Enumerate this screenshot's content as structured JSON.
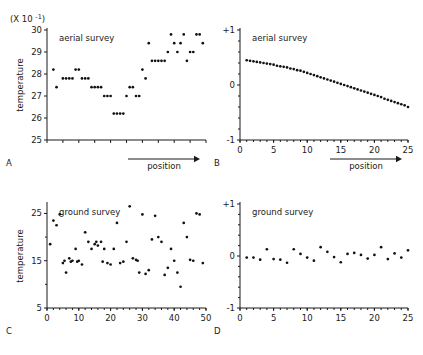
{
  "figure": {
    "multiplier_label": "(X 10",
    "multiplier_exp": "-1",
    "multiplier_close": ")"
  },
  "chart_data": [
    {
      "type": "scatter",
      "panel": "A",
      "panel_label": "A",
      "title": "aerial survey",
      "xlabel": "position",
      "ylabel": "temperature",
      "y_multiplier": "(X 10^-1)",
      "xlim": [
        0,
        50
      ],
      "ylim": [
        25,
        30
      ],
      "yticks": [
        25,
        26,
        27,
        28,
        29,
        30
      ],
      "ytick_labels": [
        "25",
        "26",
        "27",
        "28",
        "29",
        "30"
      ],
      "xticks": [],
      "xtick_labels": [],
      "grid": false,
      "x_axis_arrow": true,
      "x": [
        2,
        3,
        5,
        6,
        7,
        8,
        9,
        10,
        11,
        12,
        13,
        14,
        15,
        16,
        17,
        18,
        19,
        20,
        21,
        22,
        23,
        24,
        25,
        26,
        27,
        28,
        29,
        30,
        31,
        32,
        33,
        34,
        35,
        36,
        37,
        38,
        39,
        40,
        41,
        42,
        43,
        44,
        45,
        46,
        47,
        48,
        49
      ],
      "y": [
        28.2,
        27.4,
        27.8,
        27.8,
        27.8,
        27.8,
        28.2,
        28.2,
        27.8,
        27.8,
        27.8,
        27.4,
        27.4,
        27.4,
        27.4,
        27.0,
        27.0,
        27.0,
        26.2,
        26.2,
        26.2,
        26.2,
        27.0,
        27.4,
        27.4,
        27.0,
        27.0,
        28.2,
        27.8,
        29.4,
        28.6,
        28.6,
        28.6,
        28.6,
        28.6,
        29.0,
        29.8,
        29.4,
        29.0,
        29.4,
        29.8,
        28.6,
        29.0,
        29.0,
        29.8,
        29.8,
        29.4
      ]
    },
    {
      "type": "scatter",
      "panel": "B",
      "panel_label": "B",
      "title": "aerial survey",
      "xlabel": "position",
      "ylabel": "",
      "xlim": [
        0,
        25
      ],
      "ylim": [
        -1,
        1
      ],
      "yticks": [
        -1,
        0,
        1
      ],
      "ytick_labels": [
        "-1",
        "0",
        "+1"
      ],
      "xticks": [
        0,
        5,
        10,
        15,
        20,
        25
      ],
      "xtick_labels": [
        "0",
        "5",
        "10",
        "15",
        "20",
        "25"
      ],
      "grid": false,
      "x_axis_arrow": true,
      "x": [
        1,
        1.5,
        2,
        2.5,
        3,
        3.5,
        4,
        4.5,
        5,
        5.5,
        6,
        6.5,
        7,
        7.5,
        8,
        8.5,
        9,
        9.5,
        10,
        10.5,
        11,
        11.5,
        12,
        12.5,
        13,
        13.5,
        14,
        14.5,
        15,
        15.5,
        16,
        16.5,
        17,
        17.5,
        18,
        18.5,
        19,
        19.5,
        20,
        20.5,
        21,
        21.5,
        22,
        22.5,
        23,
        23.5,
        24,
        24.5,
        25
      ],
      "y": [
        0.45,
        0.44,
        0.43,
        0.42,
        0.41,
        0.4,
        0.39,
        0.38,
        0.37,
        0.35,
        0.34,
        0.33,
        0.32,
        0.3,
        0.29,
        0.27,
        0.26,
        0.24,
        0.22,
        0.2,
        0.18,
        0.16,
        0.14,
        0.12,
        0.1,
        0.08,
        0.06,
        0.04,
        0.02,
        0.0,
        -0.02,
        -0.04,
        -0.06,
        -0.08,
        -0.1,
        -0.12,
        -0.14,
        -0.16,
        -0.18,
        -0.2,
        -0.22,
        -0.25,
        -0.27,
        -0.29,
        -0.31,
        -0.33,
        -0.35,
        -0.37,
        -0.4
      ]
    },
    {
      "type": "scatter",
      "panel": "C",
      "panel_label": "C",
      "title": "ground survey",
      "xlabel": "",
      "ylabel": "temperature",
      "xlim": [
        0,
        50
      ],
      "ylim": [
        5,
        27
      ],
      "yticks": [
        5,
        15,
        25
      ],
      "ytick_labels": [
        "5",
        "15",
        "25"
      ],
      "xticks": [
        0,
        10,
        20,
        30,
        40,
        50
      ],
      "xtick_labels": [
        "0",
        "10",
        "20",
        "30",
        "40",
        "50"
      ],
      "grid": false,
      "x_axis_arrow": false,
      "x": [
        1,
        2,
        3,
        4,
        5,
        5.5,
        6,
        7,
        7.5,
        8,
        9,
        9.5,
        10,
        11,
        12,
        13,
        14,
        15,
        15.5,
        16,
        17,
        17.5,
        18,
        19,
        20,
        21,
        22,
        23,
        24,
        25,
        26,
        27,
        28,
        28.5,
        29,
        30,
        31,
        32,
        33,
        34,
        35,
        36,
        37,
        38,
        39,
        40,
        41,
        42,
        43,
        44,
        45,
        46,
        47,
        48,
        49
      ],
      "y": [
        18.5,
        23.5,
        22.5,
        24.8,
        14.5,
        15.0,
        12.5,
        15.5,
        14.8,
        15.0,
        17.5,
        14.8,
        15.0,
        14.2,
        21.0,
        19.0,
        17.5,
        18.5,
        19.0,
        18.2,
        19.0,
        14.8,
        17.5,
        14.5,
        14.2,
        17.5,
        23.0,
        14.5,
        14.8,
        19.0,
        26.5,
        15.5,
        15.2,
        15.0,
        12.5,
        24.8,
        12.2,
        13.0,
        19.5,
        24.5,
        20.0,
        19.0,
        12.0,
        13.5,
        17.5,
        15.0,
        12.5,
        9.5,
        23.0,
        20.0,
        15.2,
        15.0,
        25.0,
        24.8,
        14.5
      ]
    },
    {
      "type": "scatter",
      "panel": "D",
      "panel_label": "D",
      "title": "ground survey",
      "xlabel": "",
      "ylabel": "",
      "xlim": [
        0,
        25
      ],
      "ylim": [
        -1,
        1
      ],
      "yticks": [
        -1,
        0,
        1
      ],
      "ytick_labels": [
        "-1",
        "0",
        "+1"
      ],
      "xticks": [
        0,
        5,
        10,
        15,
        20,
        25
      ],
      "xtick_labels": [
        "0",
        "5",
        "10",
        "15",
        "20",
        "25"
      ],
      "grid": false,
      "x_axis_arrow": false,
      "x": [
        1,
        2,
        3,
        4,
        5,
        6,
        7,
        8,
        9,
        10,
        11,
        12,
        13,
        14,
        15,
        16,
        17,
        18,
        19,
        20,
        21,
        22,
        23,
        24,
        25
      ],
      "y": [
        -0.03,
        -0.03,
        -0.07,
        0.13,
        -0.06,
        -0.07,
        -0.13,
        0.13,
        0.04,
        -0.03,
        -0.09,
        0.17,
        0.08,
        -0.02,
        -0.12,
        0.04,
        0.06,
        0.02,
        -0.05,
        0.02,
        0.17,
        -0.06,
        0.05,
        -0.03,
        0.11
      ]
    }
  ]
}
